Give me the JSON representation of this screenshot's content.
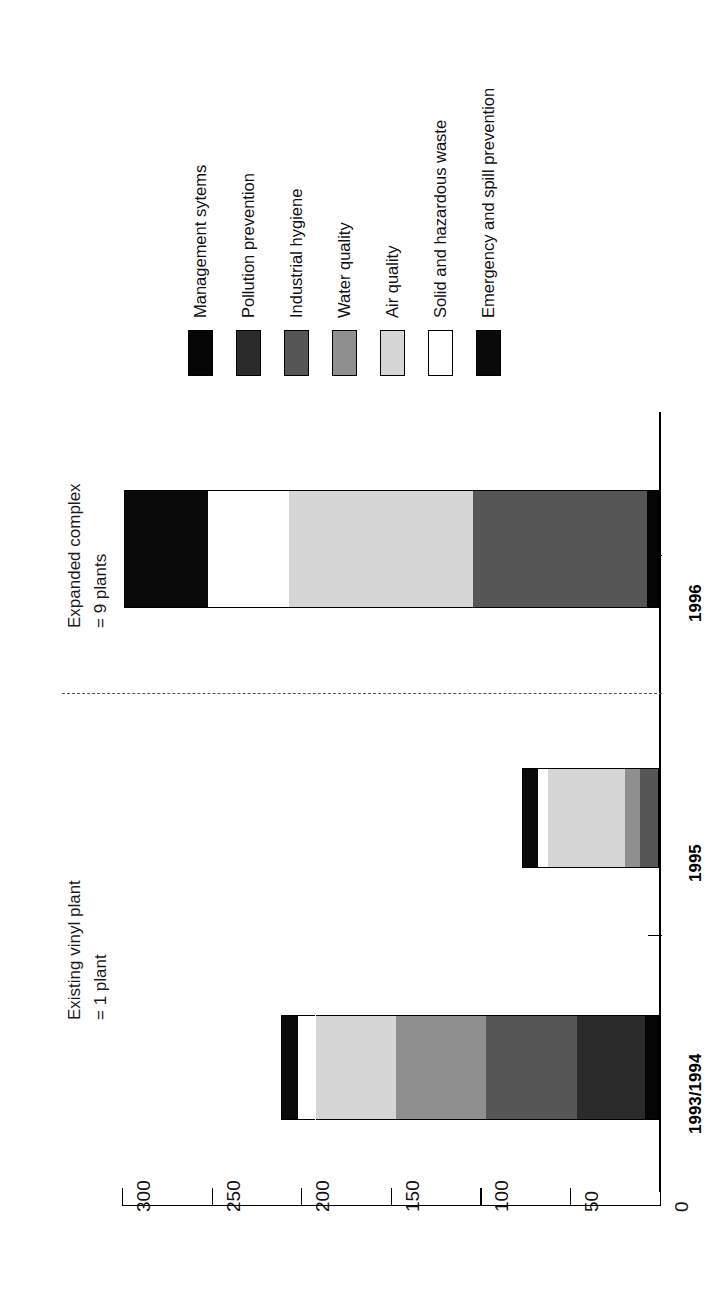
{
  "chart_data": {
    "type": "bar",
    "orientation": "horizontal-rotated",
    "title": "Findings addressed and resolved by Formosa",
    "xlabel": "",
    "ylabel": "",
    "categories": [
      "1993/1994",
      "1995",
      "1996"
    ],
    "tick_labels": [
      "300",
      "250",
      "200",
      "150",
      "100",
      "50",
      "0"
    ],
    "ticks": [
      300,
      250,
      200,
      150,
      100,
      50,
      0
    ],
    "ylim": [
      0,
      300
    ],
    "grid": false,
    "legend_position": "top",
    "stacked": true,
    "series": [
      {
        "name": "Management sytems",
        "color": "#050505",
        "values": [
          8,
          0,
          7
        ]
      },
      {
        "name": "Pollution prevention",
        "color": "#2b2b2b",
        "values": [
          38,
          0,
          0
        ]
      },
      {
        "name": "Industrial hygiene",
        "color": "#565656",
        "values": [
          51,
          11,
          97
        ]
      },
      {
        "name": "Water quality",
        "color": "#8f8f8f",
        "values": [
          50,
          8,
          0
        ]
      },
      {
        "name": "Air quality",
        "color": "#d6d6d6",
        "values": [
          45,
          43,
          103
        ]
      },
      {
        "name": "Solid and hazardous waste",
        "color": "#ffffff",
        "values": [
          10,
          6,
          45
        ]
      },
      {
        "name": "Emergency and spill prevention",
        "color": "#0a0a0a",
        "values": [
          9,
          9,
          47
        ]
      }
    ],
    "totals": [
      211,
      77,
      299
    ],
    "annotations": [
      {
        "text": "Existing vinyl plant\n= 1 plant",
        "line1": "Existing vinyl plant",
        "line2": "= 1 plant"
      },
      {
        "text": "Expanded complex\n= 9 plants",
        "line1": "Expanded complex",
        "line2": "= 9 plants"
      }
    ]
  },
  "legend": {
    "items": [
      {
        "label": "Management sytems",
        "swatch": "#050505"
      },
      {
        "label": "Pollution prevention",
        "swatch": "#2b2b2b"
      },
      {
        "label": "Industrial hygiene",
        "swatch": "#565656"
      },
      {
        "label": "Water quality",
        "swatch": "#8f8f8f"
      },
      {
        "label": "Air quality",
        "swatch": "#d6d6d6"
      },
      {
        "label": "Solid and hazardous waste",
        "swatch": "#ffffff"
      },
      {
        "label": "Emergency and spill prevention",
        "swatch": "#0a0a0a"
      }
    ]
  },
  "axis": {
    "labels": [
      "300",
      "250",
      "200",
      "150",
      "100",
      "50",
      "0"
    ]
  },
  "categories": {
    "labels": [
      "1996",
      "1995",
      "1993/1994"
    ]
  },
  "annotations": {
    "expanded_line1": "Expanded complex",
    "expanded_line2": "= 9 plants",
    "existing_line1": "Existing vinyl plant",
    "existing_line2": "= 1 plant"
  },
  "title": {
    "text": "Findings addressed and resolved by Formosa"
  }
}
